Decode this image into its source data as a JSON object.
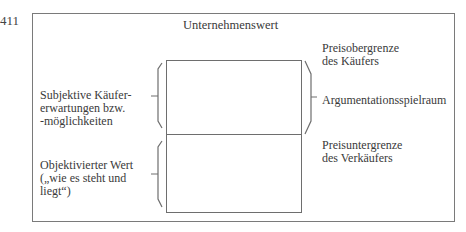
{
  "page_number": "411",
  "diagram": {
    "title": "Unternehmenswert",
    "left_labels": [
      {
        "id": "subjective",
        "text": "Subjektive Käufer-\nerwartungen bzw.\n-möglichkeiten"
      },
      {
        "id": "objective",
        "text": "Objektivierter Wert\n(„wie es steht und\nliegt“)"
      }
    ],
    "right_labels": [
      {
        "id": "upper-limit",
        "text": "Preisobergrenze\ndes Käufers"
      },
      {
        "id": "negotiation-range",
        "text": "Argumentationsspielraum"
      },
      {
        "id": "lower-limit",
        "text": "Preisuntergrenze\ndes Verkäufers"
      }
    ],
    "segments": [
      {
        "name": "Subjektive Käufererwartungen",
        "position": "upper"
      },
      {
        "name": "Objektivierter Wert",
        "position": "lower"
      }
    ],
    "colors": {
      "line": "#6e6e6e",
      "text": "#3a3a3a"
    }
  }
}
